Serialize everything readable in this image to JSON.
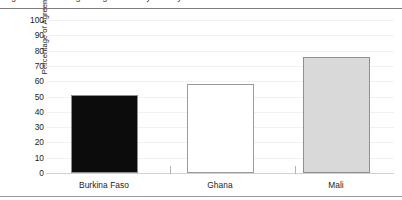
{
  "figure": {
    "caption_clipped": "Figure 2. Percentage of agreement by country",
    "background_color": "#ffffff",
    "rule_color": "#8a8a8a"
  },
  "chart_data": {
    "type": "bar",
    "title": "",
    "xlabel": "",
    "ylabel": "Percentage of Agreement",
    "categories": [
      "Burkina Faso",
      "Ghana",
      "Mali"
    ],
    "values": [
      51,
      58,
      76
    ],
    "series": [
      {
        "name": "Percentage of Agreement",
        "values": [
          51,
          58,
          76
        ]
      }
    ],
    "ylim": [
      0,
      100
    ],
    "ytick_labels": [
      "100",
      "90",
      "80",
      "70",
      "60",
      "50",
      "40",
      "30",
      "20",
      "10",
      "0"
    ],
    "ytick_values": [
      100,
      90,
      80,
      70,
      60,
      50,
      40,
      30,
      20,
      10,
      0
    ],
    "grid": true,
    "grid_axis": "y",
    "legend": false,
    "legend_position": "none",
    "bar_colors": [
      "#0c0c0c",
      "#ffffff",
      "#d9d9d9"
    ],
    "bar_border_color": "#8f8f8f",
    "annotations": []
  }
}
